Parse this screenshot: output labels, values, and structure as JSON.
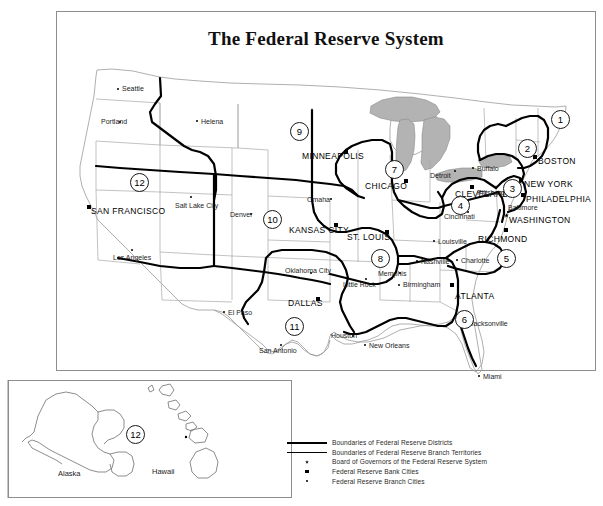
{
  "title": "The Federal Reserve System",
  "frames": {
    "main": "main-map-frame",
    "inset": "inset-map-frame"
  },
  "legend": {
    "items": [
      {
        "key": "thick-line",
        "label": "Boundaries of Federal Reserve Districts"
      },
      {
        "key": "thin-line",
        "label": "Boundaries of Federal Reserve Branch Territories"
      },
      {
        "key": "star-marker",
        "label": "Board of Governors of the Federal Reserve System"
      },
      {
        "key": "square-marker",
        "label": "Federal Reserve Bank Cities"
      },
      {
        "key": "dot-marker",
        "label": "Federal Reserve Branch Cities"
      }
    ]
  },
  "districts": [
    {
      "number": "1",
      "bank": "BOSTON",
      "x": 551,
      "y": 110
    },
    {
      "number": "2",
      "bank": "NEW YORK",
      "x": 518,
      "y": 139
    },
    {
      "number": "3",
      "bank": "PHILADELPHIA",
      "x": 503,
      "y": 179
    },
    {
      "number": "4",
      "bank": "CLEVELAND",
      "x": 451,
      "y": 196
    },
    {
      "number": "5",
      "bank": "RICHMOND",
      "x": 497,
      "y": 249
    },
    {
      "number": "6",
      "bank": "ATLANTA",
      "x": 455,
      "y": 310
    },
    {
      "number": "7",
      "bank": "CHICAGO",
      "x": 385,
      "y": 160
    },
    {
      "number": "8",
      "bank": "ST. LOUIS",
      "x": 371,
      "y": 249
    },
    {
      "number": "9",
      "bank": "MINNEAPOLIS",
      "x": 290,
      "y": 122
    },
    {
      "number": "10",
      "bank": "KANSAS CITY",
      "x": 263,
      "y": 210
    },
    {
      "number": "11",
      "bank": "DALLAS",
      "x": 285,
      "y": 317
    },
    {
      "number": "12",
      "bank": "SAN FRANCISCO",
      "x": 130,
      "y": 173
    },
    {
      "number": "12",
      "bank": "SAN FRANCISCO",
      "x": 126,
      "y": 425
    }
  ],
  "bank_cities": [
    {
      "name": "BOSTON",
      "x": 538,
      "y": 157,
      "mx": 533,
      "my": 155
    },
    {
      "name": "NEW YORK",
      "x": 524,
      "y": 180,
      "mx": 519,
      "my": 178
    },
    {
      "name": "PHILADELPHIA",
      "x": 526,
      "y": 195,
      "mx": 521,
      "my": 193
    },
    {
      "name": "CLEVELAND",
      "x": 455,
      "y": 190,
      "mx": 470,
      "my": 185
    },
    {
      "name": "RICHMOND",
      "x": 478,
      "y": 235,
      "mx": 504,
      "my": 228
    },
    {
      "name": "ATLANTA",
      "x": 455,
      "y": 292,
      "mx": 450,
      "my": 283
    },
    {
      "name": "CHICAGO",
      "x": 365,
      "y": 182,
      "mx": 404,
      "my": 179
    },
    {
      "name": "ST. LOUIS",
      "x": 347,
      "y": 233,
      "mx": 385,
      "my": 230
    },
    {
      "name": "MINNEAPOLIS",
      "x": 302,
      "y": 152,
      "mx": 344,
      "my": 150
    },
    {
      "name": "KANSAS CITY",
      "x": 289,
      "y": 226,
      "mx": 334,
      "my": 223
    },
    {
      "name": "DALLAS",
      "x": 288,
      "y": 299,
      "mx": 316,
      "my": 297
    },
    {
      "name": "SAN FRANCISCO",
      "x": 91,
      "y": 207,
      "mx": 87,
      "my": 205
    },
    {
      "name": "WASHINGTON",
      "x": 509,
      "y": 216,
      "mx": 504,
      "my": 213
    }
  ],
  "board_of_governors": {
    "city": "WASHINGTON",
    "x": 509,
    "y": 216
  },
  "branch_cities": [
    {
      "name": "Seattle",
      "x": 122,
      "y": 85,
      "mx": 117,
      "my": 88
    },
    {
      "name": "Portland",
      "x": 101,
      "y": 118,
      "mx": 119,
      "my": 121
    },
    {
      "name": "Helena",
      "x": 201,
      "y": 118,
      "mx": 196,
      "my": 120
    },
    {
      "name": "Salt Lake City",
      "x": 175,
      "y": 202,
      "mx": 190,
      "my": 196
    },
    {
      "name": "Denver",
      "x": 230,
      "y": 211,
      "mx": 250,
      "my": 213
    },
    {
      "name": "Los Angeles",
      "x": 113,
      "y": 254,
      "mx": 131,
      "my": 249
    },
    {
      "name": "Omaha",
      "x": 307,
      "y": 196,
      "mx": 330,
      "my": 198
    },
    {
      "name": "Detroit",
      "x": 430,
      "y": 172,
      "mx": 454,
      "my": 170
    },
    {
      "name": "Buffalo",
      "x": 477,
      "y": 165,
      "mx": 472,
      "my": 167
    },
    {
      "name": "Pittsburgh",
      "x": 477,
      "y": 189,
      "mx": 498,
      "my": 191
    },
    {
      "name": "Baltimore",
      "x": 508,
      "y": 204,
      "mx": 503,
      "my": 206
    },
    {
      "name": "Cincinnati",
      "x": 444,
      "y": 213,
      "mx": 467,
      "my": 211
    },
    {
      "name": "Louisville",
      "x": 438,
      "y": 238,
      "mx": 433,
      "my": 240
    },
    {
      "name": "Nashville",
      "x": 421,
      "y": 258,
      "mx": 416,
      "my": 260
    },
    {
      "name": "Charlotte",
      "x": 461,
      "y": 257,
      "mx": 456,
      "my": 259
    },
    {
      "name": "Memphis",
      "x": 378,
      "y": 270,
      "mx": 399,
      "my": 272
    },
    {
      "name": "Birmingham",
      "x": 403,
      "y": 281,
      "mx": 398,
      "my": 284
    },
    {
      "name": "Little Rock",
      "x": 343,
      "y": 281,
      "mx": 365,
      "my": 278
    },
    {
      "name": "Oklahoma City",
      "x": 285,
      "y": 267,
      "mx": 310,
      "my": 272
    },
    {
      "name": "El Paso",
      "x": 228,
      "y": 309,
      "mx": 223,
      "my": 311
    },
    {
      "name": "San Antonio",
      "x": 259,
      "y": 347,
      "mx": 280,
      "my": 344
    },
    {
      "name": "Houston",
      "x": 331,
      "y": 332,
      "mx": 352,
      "my": 335
    },
    {
      "name": "New Orleans",
      "x": 369,
      "y": 342,
      "mx": 364,
      "my": 344
    },
    {
      "name": "Jacksonville",
      "x": 470,
      "y": 320,
      "mx": 465,
      "my": 322
    },
    {
      "name": "Miami",
      "x": 483,
      "y": 373,
      "mx": 478,
      "my": 375
    }
  ],
  "inset_regions": [
    {
      "name": "Alaska",
      "x": 58,
      "y": 470
    },
    {
      "name": "Hawaii",
      "x": 152,
      "y": 468
    }
  ],
  "colors": {
    "land_fill": "#ffffff",
    "state_border": "#9a9a9a",
    "district_border": "#000000",
    "lake_fill": "#b3b3b3",
    "frame": "#8d8d8d",
    "text": "#111111"
  }
}
